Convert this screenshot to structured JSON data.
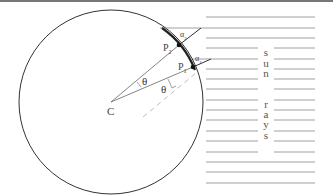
{
  "diagram": {
    "center_label": "C",
    "points": [
      {
        "label": "P",
        "sub": "1"
      },
      {
        "label": "P",
        "sub": "2"
      }
    ],
    "angles": [
      {
        "label": "α",
        "sub": "1"
      },
      {
        "label": "α",
        "sub": "2"
      }
    ],
    "theta_labels": [
      "θ",
      "θ"
    ],
    "vertical_text": [
      "s",
      "u",
      "n",
      "",
      "r",
      "a",
      "y",
      "s"
    ],
    "colors": {
      "lines": "#555555",
      "circle": "#333333",
      "rays": "#888888",
      "dashed": "#bbbbbb"
    }
  }
}
